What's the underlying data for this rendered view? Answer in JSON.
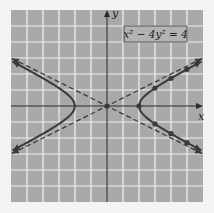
{
  "chart_data": {
    "type": "line",
    "title": "",
    "equation_label": "x² − 4y² = 4",
    "xlabel": "x",
    "ylabel": "y",
    "xlim": [
      -6,
      6
    ],
    "ylim": [
      -6,
      6
    ],
    "grid": true,
    "grid_step": 1,
    "series": [
      {
        "name": "hyperbola-right-branch",
        "style": "solid",
        "equation": "x^2 - 4y^2 = 4",
        "x_range": [
          2,
          6
        ]
      },
      {
        "name": "hyperbola-left-branch",
        "style": "solid",
        "equation": "x^2 - 4y^2 = 4",
        "x_range": [
          -6,
          -2
        ]
      },
      {
        "name": "asymptote-positive",
        "style": "dashed",
        "equation": "y = x/2",
        "x_range": [
          -6,
          6
        ]
      },
      {
        "name": "asymptote-negative",
        "style": "dashed",
        "equation": "y = -x/2",
        "x_range": [
          -6,
          6
        ]
      }
    ],
    "points": [
      {
        "x": 0,
        "y": 0
      },
      {
        "x": 2,
        "y": 0
      },
      {
        "x": 3,
        "y": 1.12
      },
      {
        "x": 3,
        "y": -1.12
      },
      {
        "x": 4,
        "y": 1.73
      },
      {
        "x": 4,
        "y": -1.73
      },
      {
        "x": 5,
        "y": 2.29
      },
      {
        "x": 5,
        "y": -2.29
      }
    ],
    "colors": {
      "background": "#a9a9a9",
      "grid": "#f2f2f2",
      "curve": "#3a3a3a",
      "axis": "#2a2a2a",
      "label_box": "#b3b3b3"
    }
  }
}
